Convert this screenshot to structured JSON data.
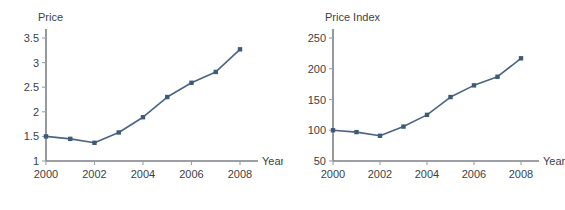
{
  "chart_data": [
    {
      "type": "line",
      "title": "Price",
      "xlabel": "Year",
      "ylabel": "Price",
      "x": [
        2000,
        2001,
        2002,
        2003,
        2004,
        2005,
        2006,
        2007,
        2008
      ],
      "values": [
        1.5,
        1.45,
        1.37,
        1.58,
        1.89,
        2.3,
        2.59,
        2.81,
        3.27
      ],
      "xticklabels": [
        "2000",
        "2002",
        "2004",
        "2006",
        "2008"
      ],
      "xticks": [
        2000,
        2002,
        2004,
        2006,
        2008
      ],
      "yticklabels": [
        "1",
        "1.5",
        "2",
        "2.5",
        "3",
        "3.5"
      ],
      "yticks": [
        1,
        1.5,
        2,
        2.5,
        3,
        3.5
      ],
      "xlim": [
        2000,
        2008
      ],
      "ylim": [
        1,
        3.5
      ],
      "grid": false,
      "legend": "none",
      "series_color": "#4a6583",
      "marker_color": "#3f5a77"
    },
    {
      "type": "line",
      "title": "Price Index",
      "xlabel": "Year",
      "ylabel": "Price Index",
      "x": [
        2000,
        2001,
        2002,
        2003,
        2004,
        2005,
        2006,
        2007,
        2008
      ],
      "values": [
        100,
        97,
        91,
        106,
        125,
        154,
        173,
        187,
        217
      ],
      "xticklabels": [
        "2000",
        "2002",
        "2004",
        "2006",
        "2008"
      ],
      "xticks": [
        2000,
        2002,
        2004,
        2006,
        2008
      ],
      "yticklabels": [
        "50",
        "100",
        "150",
        "200",
        "250"
      ],
      "yticks": [
        50,
        100,
        150,
        200,
        250
      ],
      "xlim": [
        2000,
        2008
      ],
      "ylim": [
        50,
        250
      ],
      "grid": false,
      "legend": "none",
      "series_color": "#4a6583",
      "marker_color": "#3f5a77"
    }
  ]
}
